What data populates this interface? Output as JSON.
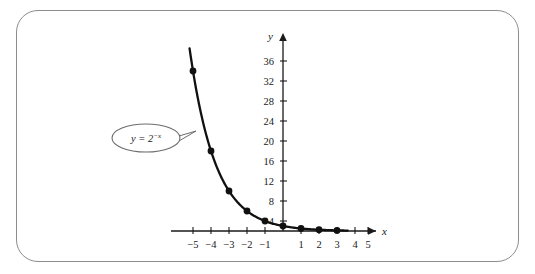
{
  "figure": {
    "frame_color": "#8d8d8d",
    "background": "#ffffff",
    "curve_color": "#111111",
    "axis_color": "#1a1a1a"
  },
  "annotation": {
    "base_text": "y = 2",
    "exponent_text": "−x",
    "full_label": "y = 2^(−x)"
  },
  "axis": {
    "x_name": "x",
    "y_name": "y"
  },
  "chart_data": {
    "type": "line",
    "title": "",
    "xlabel": "x",
    "ylabel": "y",
    "xlim": [
      -5.6,
      5.6
    ],
    "ylim": [
      0,
      38
    ],
    "grid": false,
    "legend": "none",
    "annotations": [
      "y = 2^(−x)"
    ],
    "x_ticks": [
      -5,
      -4,
      -3,
      -2,
      -1,
      1,
      2,
      3,
      4,
      5
    ],
    "x_tick_labels": [
      "−5",
      "−4",
      "−3",
      "−2",
      "−1",
      "1",
      "2",
      "3",
      "4",
      "5"
    ],
    "y_ticks": [
      4,
      8,
      12,
      16,
      20,
      24,
      28,
      32,
      36
    ],
    "y_tick_labels": [
      "4",
      "8",
      "12",
      "16",
      "20",
      "24",
      "28",
      "32",
      "36"
    ],
    "series": [
      {
        "name": "y = 2^(−x)",
        "x": [
          -5,
          -4,
          -3,
          -2,
          -1,
          0,
          1,
          2,
          3
        ],
        "values": [
          32,
          16,
          8,
          4,
          2,
          1,
          0.5,
          0.25,
          0.125
        ],
        "marker": "filled-circle"
      }
    ]
  }
}
